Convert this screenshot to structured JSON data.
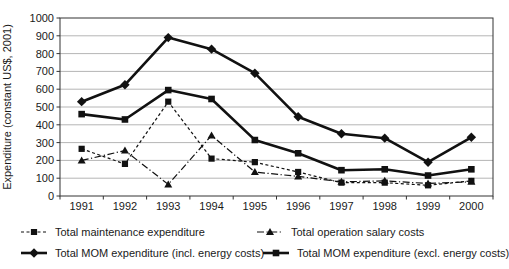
{
  "chart_data": {
    "type": "line",
    "title": "",
    "xlabel": "",
    "ylabel": "Expenditure (constant US$, 2001)",
    "ylim": [
      0,
      1000
    ],
    "ytick_step": 100,
    "yticks": [
      0,
      100,
      200,
      300,
      400,
      500,
      600,
      700,
      800,
      900,
      1000
    ],
    "categories": [
      "1991",
      "1992",
      "1993",
      "1994",
      "1995",
      "1996",
      "1997",
      "1998",
      "1999",
      "2000"
    ],
    "series": [
      {
        "name": "Total maintenance expenditure",
        "marker": "square",
        "line_style": "dashed",
        "line_width": 1.2,
        "marker_size": 3.1,
        "values": [
          265,
          180,
          530,
          210,
          190,
          135,
          75,
          75,
          60,
          85
        ]
      },
      {
        "name": "Total operation salary costs",
        "marker": "triangle",
        "line_style": "dashdot",
        "line_width": 1.2,
        "marker_size": 3.4,
        "values": [
          200,
          255,
          65,
          340,
          135,
          110,
          80,
          85,
          70,
          80
        ]
      },
      {
        "name": "Total MOM expenditure (incl. energy costs)",
        "marker": "diamond",
        "line_style": "solid",
        "line_width": 2.6,
        "marker_size": 3.8,
        "values": [
          530,
          625,
          890,
          825,
          690,
          445,
          350,
          325,
          190,
          330
        ]
      },
      {
        "name": "Total MOM expenditure (excl. energy costs)",
        "marker": "square",
        "line_style": "solid",
        "line_width": 2.6,
        "marker_size": 3.3,
        "values": [
          460,
          430,
          595,
          545,
          315,
          240,
          145,
          150,
          115,
          150
        ]
      }
    ],
    "legend_position": "bottom",
    "grid": "horizontal",
    "colors": {
      "line": "#111111",
      "grid": "#b5b5b5",
      "axis": "#333333",
      "text": "#1a1a1a",
      "background": "#ffffff"
    }
  }
}
